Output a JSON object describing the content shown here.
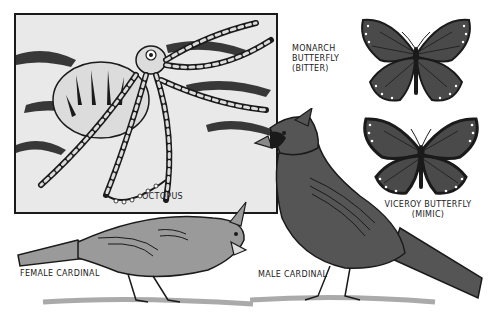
{
  "figure": {
    "panels": [
      {
        "id": "octopus",
        "label": "OCTOPUS"
      },
      {
        "id": "monarch",
        "label_lines": [
          "MONARCH",
          "BUTTERFLY",
          "(BITTER)"
        ]
      },
      {
        "id": "viceroy",
        "label_lines": [
          "VICEROY  BUTTERFLY",
          "(MIMIC)"
        ]
      },
      {
        "id": "female-cardinal",
        "label": "FEMALE  CARDINAL"
      },
      {
        "id": "male-cardinal",
        "label": "MALE  CARDINAL"
      }
    ]
  },
  "colors": {
    "ink": "#1a1a1a",
    "dark_wing": "#4a4a4a",
    "male_body": "#555555",
    "female_body": "#9a9a9a",
    "background": "#ffffff",
    "box_fill": "#e9e9e9"
  }
}
